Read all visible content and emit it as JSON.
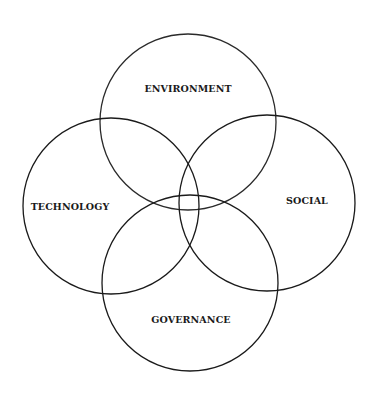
{
  "diagram": {
    "type": "venn",
    "circles": [
      {
        "id": "environment",
        "label": "ENVIRONMENT",
        "cx": 188,
        "cy": 122,
        "r": 88,
        "label_x": 188,
        "label_y": 89
      },
      {
        "id": "technology",
        "label": "TECHNOLOGY",
        "cx": 111,
        "cy": 206,
        "r": 88,
        "label_x": 70,
        "label_y": 207
      },
      {
        "id": "social",
        "label": "SOCIAL",
        "cx": 267,
        "cy": 203,
        "r": 88,
        "label_x": 307,
        "label_y": 203
      },
      {
        "id": "governance",
        "label": "GOVERNANCE",
        "cx": 190,
        "cy": 283,
        "r": 88,
        "label_x": 191,
        "label_y": 322
      }
    ],
    "stroke_color": "#1a1a1a"
  }
}
